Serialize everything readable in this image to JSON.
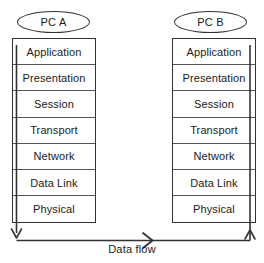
{
  "diagram": {
    "background_color": "#ffffff",
    "line_color": "#333333",
    "text_color": "#1a1a1a",
    "nodes": [
      {
        "id": "pc-a",
        "label": "PC A"
      },
      {
        "id": "pc-b",
        "label": "PC B"
      }
    ],
    "layers": [
      {
        "label": "Application"
      },
      {
        "label": "Presentation"
      },
      {
        "label": "Session"
      },
      {
        "label": "Transport"
      },
      {
        "label": "Network"
      },
      {
        "label": "Data Link"
      },
      {
        "label": "Physical"
      }
    ],
    "flow": {
      "caption": "Data flow",
      "direction": "pc-a-down-across-up-pc-b",
      "arrowheads": [
        "down-left",
        "right-middle",
        "up-right"
      ]
    }
  }
}
